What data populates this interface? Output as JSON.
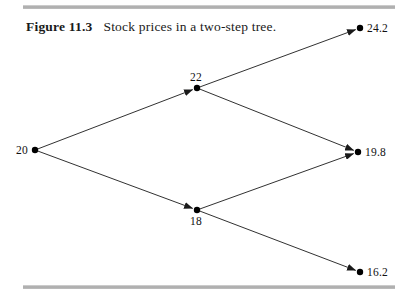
{
  "figure": {
    "number_label": "Figure 11.3",
    "caption_text": "Stock prices in a two-step tree."
  },
  "rules": {
    "top_present": true,
    "bottom_present": true,
    "color": "#a9a9a9"
  },
  "chart_data": {
    "type": "diagram",
    "diagram_kind": "binomial-tree",
    "title": "Stock prices in a two-step tree.",
    "steps": 2,
    "line_color": "#1a1a1a",
    "node_color": "#000000",
    "nodes": [
      {
        "id": "root",
        "label": "20",
        "x": 35,
        "y": 150,
        "label_pos": "left"
      },
      {
        "id": "up",
        "label": "22",
        "x": 197,
        "y": 88,
        "label_pos": "above"
      },
      {
        "id": "down",
        "label": "18",
        "x": 197,
        "y": 210,
        "label_pos": "below"
      },
      {
        "id": "upup",
        "label": "24.2",
        "x": 360,
        "y": 28,
        "label_pos": "right"
      },
      {
        "id": "updown",
        "label": "19.8",
        "x": 358,
        "y": 152,
        "label_pos": "right"
      },
      {
        "id": "downdown",
        "label": "16.2",
        "x": 360,
        "y": 272,
        "label_pos": "right"
      }
    ],
    "edges": [
      {
        "from": "root",
        "to": "up",
        "arrow": true
      },
      {
        "from": "root",
        "to": "down",
        "arrow": true
      },
      {
        "from": "up",
        "to": "upup",
        "arrow": true
      },
      {
        "from": "up",
        "to": "updown",
        "arrow": true
      },
      {
        "from": "down",
        "to": "updown",
        "arrow": true
      },
      {
        "from": "down",
        "to": "downdown",
        "arrow": true
      }
    ]
  }
}
